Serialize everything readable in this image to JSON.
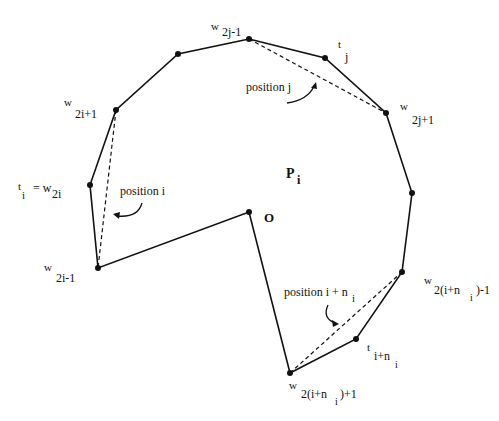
{
  "diagram": {
    "colors": {
      "stroke": "#111111",
      "background": "#ffffff"
    },
    "region_label": {
      "main": "P",
      "sub": "i"
    },
    "origin_label": "O",
    "vertices": [
      {
        "id": "w2j-1",
        "x": 249,
        "y": 39
      },
      {
        "id": "v_a",
        "x": 178,
        "y": 54
      },
      {
        "id": "w2i+1",
        "x": 116,
        "y": 110
      },
      {
        "id": "ti",
        "x": 90,
        "y": 185
      },
      {
        "id": "w2i-1",
        "x": 98,
        "y": 268
      },
      {
        "id": "O",
        "x": 249,
        "y": 212
      },
      {
        "id": "w2(i+ni)+1",
        "x": 290,
        "y": 373
      },
      {
        "id": "t_i+ni",
        "x": 356,
        "y": 339
      },
      {
        "id": "w2(i+ni)-1",
        "x": 402,
        "y": 272
      },
      {
        "id": "v_b",
        "x": 412,
        "y": 193
      },
      {
        "id": "w2j+1",
        "x": 386,
        "y": 113
      },
      {
        "id": "tj",
        "x": 325,
        "y": 58
      }
    ],
    "labels": {
      "w2j_minus_1": {
        "base": "w",
        "sub": "2j-1"
      },
      "tj": {
        "base": "t",
        "sub": "j"
      },
      "w2j_plus_1": {
        "base": "w",
        "sub": "2j+1"
      },
      "w2i_plus_1": {
        "base": "w",
        "sub": "2i+1"
      },
      "ti_eq": {
        "base": "t",
        "sub": "i",
        "eq": "= w",
        "eq_sub": "2i"
      },
      "w2i_minus_1": {
        "base": "w",
        "sub": "2i-1"
      },
      "w_end_minus": {
        "base": "w",
        "sub": "2(i+n",
        "subsub": "i",
        "tail": ")-1"
      },
      "t_i_ni": {
        "base": "t",
        "sub": "i+n",
        "subsub": "i"
      },
      "w_end_plus": {
        "base": "w",
        "sub": "2(i+n",
        "subsub": "i",
        "tail": " )+1"
      }
    },
    "positions": {
      "j": "position j",
      "i": "position i",
      "i_ni": "position i + n",
      "i_ni_sub": "i"
    }
  }
}
